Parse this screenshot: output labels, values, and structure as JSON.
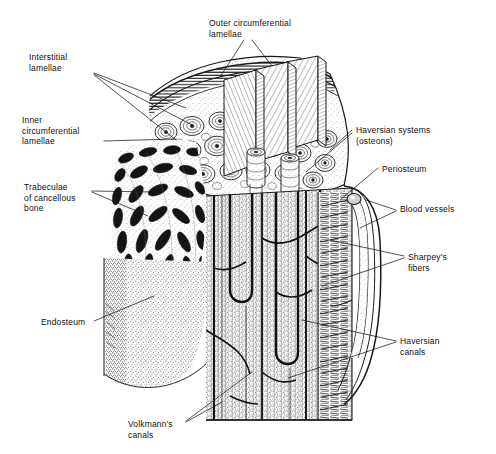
{
  "figure": {
    "ink_color": "#1a1a1a",
    "background_color": "#ffffff",
    "width": 496,
    "height": 454
  },
  "labels": {
    "outer_circumferential_lamellae": "Outer circumferential\nlamellae",
    "interstitial_lamellae": "Interstitial\nlamellae",
    "inner_circumferential_lamellae": "Inner\ncircumferential\nlamellae",
    "trabeculae_of_cancellous_bone": "Trabeculae\nof cancellous\nbone",
    "endosteum": "Endosteum",
    "volkmanns_canals": "Volkmann's\ncanals",
    "haversian_systems": "Haversian systems\n(osteons)",
    "periosteum": "Periosteum",
    "blood_vessels": "Blood vessels",
    "sharpeys_fibers": "Sharpey's\nfibers",
    "haversian_canals": "Haversian\ncanals"
  },
  "label_positions": {
    "outer_circumferential_lamellae": {
      "x": 209,
      "y": 18
    },
    "interstitial_lamellae": {
      "x": 29,
      "y": 52
    },
    "inner_circumferential_lamellae": {
      "x": 22,
      "y": 115
    },
    "trabeculae_of_cancellous_bone": {
      "x": 24,
      "y": 182
    },
    "endosteum": {
      "x": 41,
      "y": 317
    },
    "volkmanns_canals": {
      "x": 128,
      "y": 419
    },
    "haversian_systems": {
      "x": 356,
      "y": 125
    },
    "periosteum": {
      "x": 382,
      "y": 164
    },
    "blood_vessels": {
      "x": 400,
      "y": 204
    },
    "sharpeys_fibers": {
      "x": 408,
      "y": 252
    },
    "haversian_canals": {
      "x": 400,
      "y": 336
    }
  }
}
